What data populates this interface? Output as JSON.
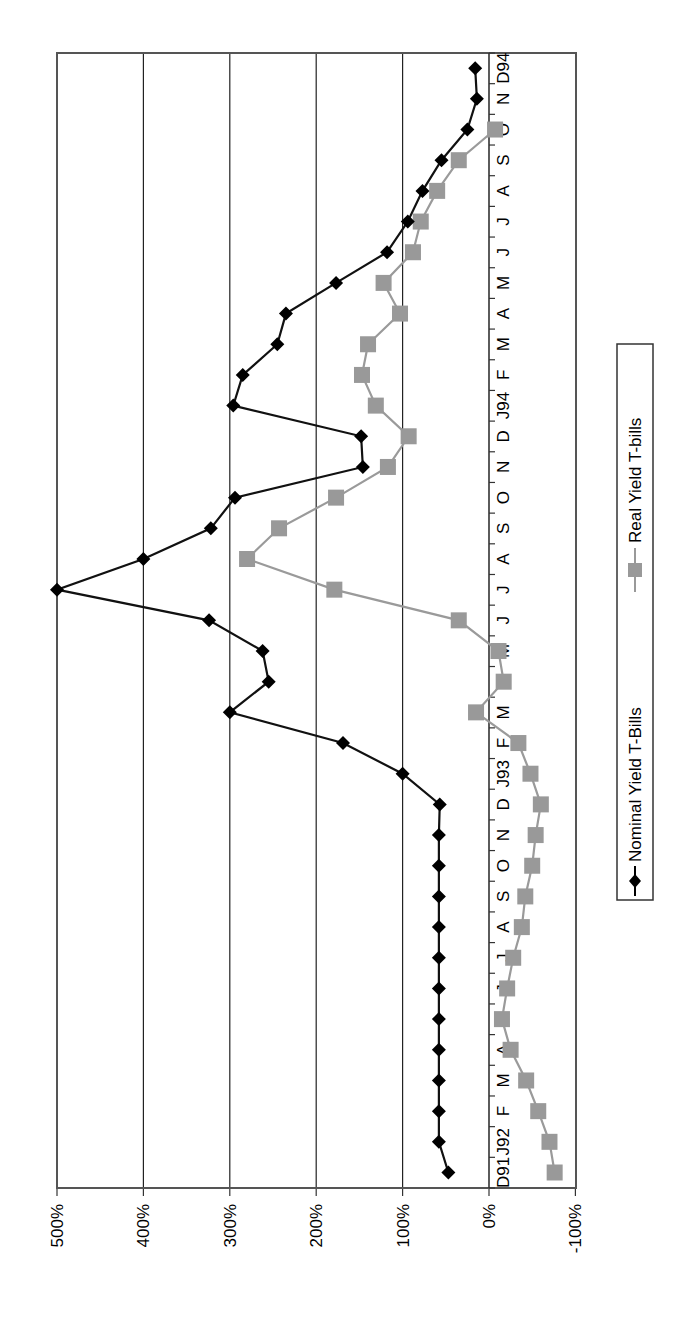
{
  "chart_data": {
    "type": "line",
    "orientation": "rotated-90-ccw",
    "title": "",
    "xlabel": "",
    "ylabel": "",
    "ylim": [
      -100,
      500
    ],
    "yticks": [
      -100,
      0,
      100,
      200,
      300,
      400,
      500
    ],
    "ytick_labels": [
      "-100%",
      "0%",
      "100%",
      "200%",
      "300%",
      "400%",
      "500%"
    ],
    "grid": "major y gridlines",
    "legend_position": "right (bottom after rotation)",
    "categories": [
      "D91",
      "J92",
      "F",
      "M",
      "A",
      "M",
      "J",
      "J",
      "A",
      "S",
      "O",
      "N",
      "D",
      "J93",
      "F",
      "M",
      "A",
      "M",
      "J",
      "J",
      "A",
      "S",
      "O",
      "N",
      "D",
      "J94",
      "F",
      "M",
      "A",
      "M",
      "J",
      "J",
      "A",
      "S",
      "O",
      "N",
      "D94"
    ],
    "series": [
      {
        "name": "Nominal Yield T-Bills",
        "color": "#000000",
        "marker": "diamond",
        "values": [
          47,
          58,
          58,
          58,
          58,
          58,
          58,
          58,
          58,
          58,
          58,
          58,
          57,
          100,
          169,
          300,
          255,
          262,
          324,
          500,
          400,
          322,
          294,
          146,
          148,
          296,
          285,
          245,
          235,
          177,
          118,
          94,
          77,
          55,
          25,
          14,
          16
        ]
      },
      {
        "name": "Real Yield T-bills",
        "color": "#999999",
        "marker": "square",
        "values": [
          -76,
          -70,
          -57,
          -43,
          -25,
          -15,
          -21,
          -28,
          -38,
          -42,
          -50,
          -54,
          -60,
          -48,
          -34,
          15,
          -17,
          -11,
          35,
          179,
          280,
          243,
          177,
          117,
          93,
          131,
          147,
          140,
          103,
          122,
          88,
          79,
          60,
          35,
          -7,
          null,
          null
        ]
      }
    ]
  },
  "legend": {
    "items": [
      {
        "label": "Nominal Yield T-Bills"
      },
      {
        "label": "Real Yield T-bills"
      }
    ]
  }
}
